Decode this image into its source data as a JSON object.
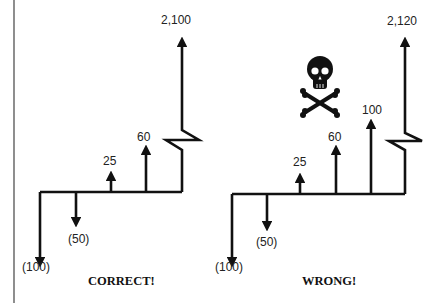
{
  "diagrams": [
    {
      "caption": "CORRECT!",
      "flows": [
        {
          "label": "(100)",
          "value": -100
        },
        {
          "label": "(50)",
          "value": -50
        },
        {
          "label": "25",
          "value": 25
        },
        {
          "label": "60",
          "value": 60
        },
        {
          "label": "2,100",
          "value": 2100
        }
      ]
    },
    {
      "caption": "WRONG!",
      "flows": [
        {
          "label": "(100)",
          "value": -100
        },
        {
          "label": "(50)",
          "value": -50
        },
        {
          "label": "25",
          "value": 25
        },
        {
          "label": "60",
          "value": 60
        },
        {
          "label": "100",
          "value": 100
        },
        {
          "label": "2,120",
          "value": 2120
        }
      ],
      "warning_icon": "skull-and-crossbones-icon"
    }
  ]
}
